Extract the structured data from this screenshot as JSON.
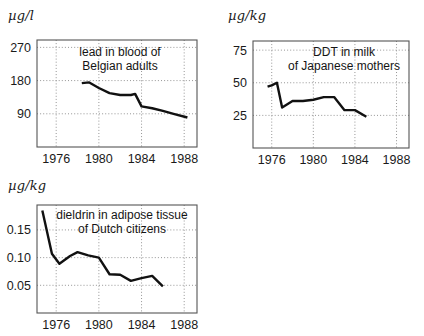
{
  "figure": {
    "background": "#ffffff",
    "line_color": "#111111",
    "frame_color": "#555555",
    "grid_color": "#8a8a8a"
  },
  "panels": [
    {
      "id": "lead-blood-belgium",
      "unit_label": "µg/l",
      "annotation_lines": [
        "lead in blood of",
        "Belgian adults"
      ],
      "y_ticks": [
        "90",
        "180",
        "270"
      ],
      "x_ticks": [
        "1976",
        "1980",
        "1984",
        "1988"
      ]
    },
    {
      "id": "ddt-milk-japan",
      "unit_label": "µg/kg",
      "annotation_lines": [
        "DDT in milk",
        "of Japanese mothers"
      ],
      "y_ticks": [
        "25",
        "50",
        "75"
      ],
      "x_ticks": [
        "1976",
        "1980",
        "1984",
        "1988"
      ]
    },
    {
      "id": "dieldrin-adipose-netherlands",
      "unit_label": "µg/kg",
      "annotation_lines": [
        "dieldrin in adipose tissue",
        "of Dutch citizens"
      ],
      "y_ticks": [
        "0.05",
        "0.10",
        "0.15"
      ],
      "x_ticks": [
        "1976",
        "1980",
        "1984",
        "1988"
      ]
    }
  ],
  "chart_data": [
    {
      "type": "line",
      "title": "lead in blood of Belgian adults",
      "xlabel": "",
      "ylabel": "µg/l",
      "xlim": [
        1974.2,
        1989.2
      ],
      "ylim": [
        0,
        290
      ],
      "yticks": [
        90,
        180,
        270
      ],
      "xticks": [
        1976,
        1980,
        1984,
        1988
      ],
      "grid": "dotted-both",
      "legend": "none",
      "x": [
        1978.4,
        1979.1,
        1980.0,
        1981.0,
        1982.0,
        1983.0,
        1983.4,
        1984.0,
        1985.0,
        1986.0,
        1987.0,
        1988.3
      ],
      "values": [
        173,
        175,
        160,
        146,
        141,
        141,
        144,
        110,
        105,
        98,
        90,
        80
      ]
    },
    {
      "type": "line",
      "title": "DDT in milk of Japanese mothers",
      "xlabel": "",
      "ylabel": "µg/kg",
      "xlim": [
        1974.2,
        1989.2
      ],
      "ylim": [
        0,
        82
      ],
      "yticks": [
        25,
        50,
        75
      ],
      "xticks": [
        1976,
        1980,
        1984,
        1988
      ],
      "grid": "dotted-both",
      "legend": "none",
      "x": [
        1975.6,
        1976.0,
        1976.5,
        1977.0,
        1978.0,
        1979.0,
        1980.0,
        1981.0,
        1982.0,
        1983.0,
        1984.0,
        1985.1
      ],
      "values": [
        47,
        48,
        50,
        31,
        36,
        36,
        37,
        39,
        39,
        29,
        29,
        24
      ]
    },
    {
      "type": "line",
      "title": "dieldrin in adipose tissue of Dutch citizens",
      "xlabel": "",
      "ylabel": "µg/kg",
      "xlim": [
        1974.2,
        1989.2
      ],
      "ylim": [
        0,
        0.195
      ],
      "yticks": [
        0.05,
        0.1,
        0.15
      ],
      "xticks": [
        1976,
        1980,
        1984,
        1988
      ],
      "grid": "dotted-both",
      "legend": "none",
      "x": [
        1974.7,
        1975.6,
        1976.3,
        1977.3,
        1978.0,
        1979.0,
        1980.0,
        1981.0,
        1982.0,
        1983.0,
        1984.0,
        1985.0,
        1986.0
      ],
      "values": [
        0.185,
        0.107,
        0.089,
        0.103,
        0.11,
        0.104,
        0.1,
        0.07,
        0.069,
        0.058,
        0.063,
        0.067,
        0.048
      ]
    }
  ]
}
